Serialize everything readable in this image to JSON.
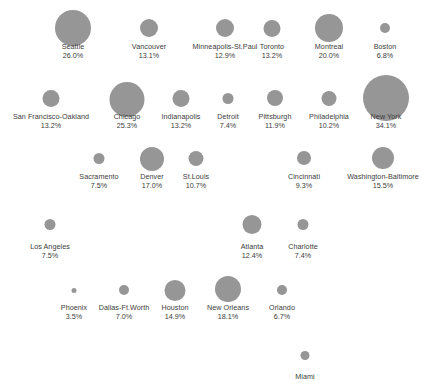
{
  "chart_data": {
    "type": "scatter",
    "title": "",
    "subtitle": "",
    "xlabel": "",
    "ylabel": "",
    "legend": "none",
    "grid": false,
    "size_encoding": "percent",
    "marker_color": "#969696",
    "text_color": "#3b3b3b",
    "background": "#ffffff",
    "categories": [
      "Seattle",
      "Vancouver",
      "Minneapolis-St.Paul",
      "Toronto",
      "Montreal",
      "Boston",
      "San Francisco-Oakland",
      "Chicago",
      "Indianapolis",
      "Detroit",
      "Pittsburgh",
      "Philadelphia",
      "New York",
      "Sacramento",
      "Denver",
      "St.Louis",
      "Cincinnati",
      "Washington-Baltimore",
      "Los Angeles",
      "Atlanta",
      "Charlotte",
      "Phoenix",
      "Dallas-Ft.Worth",
      "Houston",
      "New Orleans",
      "Orlando",
      "Miami"
    ],
    "values": [
      26.0,
      13.1,
      12.9,
      13.2,
      20.0,
      6.8,
      13.2,
      25.3,
      13.2,
      7.4,
      11.9,
      10.2,
      34.1,
      7.5,
      17.0,
      10.7,
      9.3,
      15.5,
      7.5,
      12.4,
      7.4,
      3.5,
      7.0,
      14.9,
      18.1,
      6.7,
      null
    ],
    "points": [
      {
        "name": "Seattle",
        "value_label": "26.0%",
        "value": 26.0,
        "x": 73,
        "y": 28,
        "r": 18
      },
      {
        "name": "Vancouver",
        "value_label": "13.1%",
        "value": 13.1,
        "x": 149,
        "y": 28,
        "r": 9
      },
      {
        "name": "Minneapolis-St.Paul",
        "value_label": "12.9%",
        "value": 12.9,
        "x": 225,
        "y": 28,
        "r": 9
      },
      {
        "name": "Toronto",
        "value_label": "13.2%",
        "value": 13.2,
        "x": 272,
        "y": 28,
        "r": 8.5
      },
      {
        "name": "Montreal",
        "value_label": "20.0%",
        "value": 20.0,
        "x": 329,
        "y": 28,
        "r": 14
      },
      {
        "name": "Boston",
        "value_label": "6.8%",
        "value": 6.8,
        "x": 385,
        "y": 28,
        "r": 5
      },
      {
        "name": "San Francisco-Oakland",
        "value_label": "13.2%",
        "value": 13.2,
        "x": 51,
        "y": 98,
        "r": 8.5
      },
      {
        "name": "Chicago",
        "value_label": "25.3%",
        "value": 25.3,
        "x": 127,
        "y": 99,
        "r": 17.5
      },
      {
        "name": "Indianapolis",
        "value_label": "13.2%",
        "value": 13.2,
        "x": 181,
        "y": 98,
        "r": 8.5
      },
      {
        "name": "Detroit",
        "value_label": "7.4%",
        "value": 7.4,
        "x": 228,
        "y": 98,
        "r": 5.5
      },
      {
        "name": "Pittsburgh",
        "value_label": "11.9%",
        "value": 11.9,
        "x": 275,
        "y": 98,
        "r": 8
      },
      {
        "name": "Philadelphia",
        "value_label": "10.2%",
        "value": 10.2,
        "x": 329,
        "y": 98,
        "r": 7.5
      },
      {
        "name": "New York",
        "value_label": "34.1%",
        "value": 34.1,
        "x": 386,
        "y": 98,
        "r": 23
      },
      {
        "name": "Sacramento",
        "value_label": "7.5%",
        "value": 7.5,
        "x": 99,
        "y": 158,
        "r": 5.5
      },
      {
        "name": "Denver",
        "value_label": "17.0%",
        "value": 17.0,
        "x": 152,
        "y": 159,
        "r": 12
      },
      {
        "name": "St.Louis",
        "value_label": "10.7%",
        "value": 10.7,
        "x": 196,
        "y": 158,
        "r": 7.5
      },
      {
        "name": "Cincinnati",
        "value_label": "9.3%",
        "value": 9.3,
        "x": 304,
        "y": 158,
        "r": 7
      },
      {
        "name": "Washington-Baltimore",
        "value_label": "15.5%",
        "value": 15.5,
        "x": 383,
        "y": 158,
        "r": 11
      },
      {
        "name": "Los Angeles",
        "value_label": "7.5%",
        "value": 7.5,
        "x": 50,
        "y": 224,
        "r": 5.5
      },
      {
        "name": "Atlanta",
        "value_label": "12.4%",
        "value": 12.4,
        "x": 252,
        "y": 224,
        "r": 9.5
      },
      {
        "name": "Charlotte",
        "value_label": "7.4%",
        "value": 7.4,
        "x": 303,
        "y": 224,
        "r": 5.5
      },
      {
        "name": "Phoenix",
        "value_label": "3.5%",
        "value": 3.5,
        "x": 74,
        "y": 290,
        "r": 2.5
      },
      {
        "name": "Dallas-Ft.Worth",
        "value_label": "7.0%",
        "value": 7.0,
        "x": 124,
        "y": 290,
        "r": 5
      },
      {
        "name": "Houston",
        "value_label": "14.9%",
        "value": 14.9,
        "x": 175,
        "y": 290,
        "r": 10.5
      },
      {
        "name": "New Orleans",
        "value_label": "18.1%",
        "value": 18.1,
        "x": 228,
        "y": 289,
        "r": 13
      },
      {
        "name": "Orlando",
        "value_label": "6.7%",
        "value": 6.7,
        "x": 282,
        "y": 290,
        "r": 5
      },
      {
        "name": "Miami",
        "value_label": "",
        "value": null,
        "x": 305,
        "y": 355,
        "r": 4.5
      }
    ]
  }
}
